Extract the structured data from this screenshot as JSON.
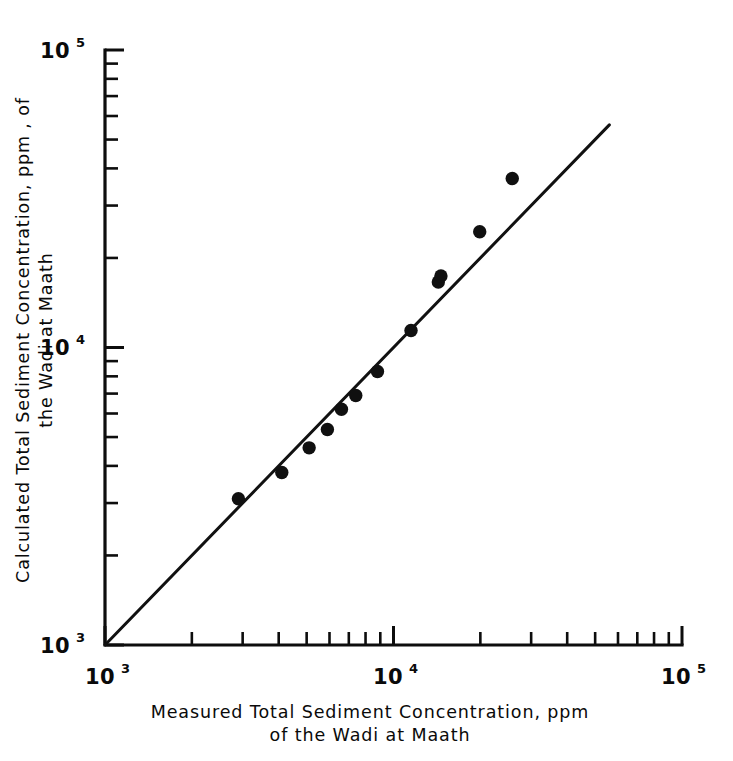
{
  "chart_data": {
    "type": "scatter",
    "title": "",
    "xlabel": "Measured Total Sediment Concentration, ppm of the Wadi at Maath",
    "ylabel": "Calculated Total Sediment Concentration, ppm, of the Wadi at Maath",
    "xscale": "log",
    "yscale": "log",
    "xlim": [
      1000,
      100000
    ],
    "ylim": [
      1000,
      100000
    ],
    "grid": false,
    "legend": null,
    "x": [
      2900,
      4100,
      5100,
      5900,
      6600,
      7400,
      8800,
      11500,
      14300,
      14600,
      19900,
      25800
    ],
    "y": [
      3100,
      3800,
      4600,
      5300,
      6200,
      6900,
      8300,
      11400,
      16600,
      17400,
      24500,
      37000
    ],
    "series": [
      {
        "name": "Wadi at Maath samples",
        "points": [
          {
            "x": 2900,
            "y": 3100
          },
          {
            "x": 4100,
            "y": 3800
          },
          {
            "x": 5100,
            "y": 4600
          },
          {
            "x": 5900,
            "y": 5300
          },
          {
            "x": 6600,
            "y": 6200
          },
          {
            "x": 7400,
            "y": 6900
          },
          {
            "x": 8800,
            "y": 8300
          },
          {
            "x": 11500,
            "y": 11400
          },
          {
            "x": 14300,
            "y": 16600
          },
          {
            "x": 14600,
            "y": 17400
          },
          {
            "x": 19900,
            "y": 24500
          },
          {
            "x": 25800,
            "y": 37000
          }
        ]
      }
    ],
    "reference_line": {
      "name": "line-of-agreement",
      "type": "identity",
      "from": {
        "x": 1000,
        "y": 1000
      },
      "to": {
        "x": 56000,
        "y": 56000
      }
    },
    "xticks_major": [
      {
        "value": 1000,
        "mantissa": "10",
        "exponent": "3"
      },
      {
        "value": 10000,
        "mantissa": "10",
        "exponent": "4"
      },
      {
        "value": 100000,
        "mantissa": "10",
        "exponent": "5"
      }
    ],
    "yticks_major": [
      {
        "value": 1000,
        "mantissa": "10",
        "exponent": "3"
      },
      {
        "value": 10000,
        "mantissa": "10",
        "exponent": "4"
      },
      {
        "value": 100000,
        "mantissa": "10",
        "exponent": "5"
      }
    ],
    "xticks_minor": [
      2000,
      3000,
      4000,
      5000,
      6000,
      7000,
      8000,
      9000,
      20000,
      30000,
      40000,
      50000,
      60000,
      70000,
      80000,
      90000
    ],
    "yticks_minor": [
      2000,
      3000,
      4000,
      5000,
      6000,
      7000,
      8000,
      9000,
      20000,
      30000,
      40000,
      50000,
      60000,
      70000,
      80000,
      90000
    ],
    "marker": {
      "shape": "circle",
      "color": "#101010",
      "size": 9
    }
  },
  "axes": {
    "x_label_line1": "Measured  Total  Sediment  Concentration, ppm",
    "x_label_line2": "of  the  Wadi  at  Maath",
    "y_label_line1": "Calculated  Total  Sediment  Concentration,  ppm ,  of",
    "y_label_line2": "the  Wadi  at  Maath"
  },
  "colors": {
    "ink": "#0d0d0d",
    "background": "#ffffff",
    "marker": "#101010"
  }
}
